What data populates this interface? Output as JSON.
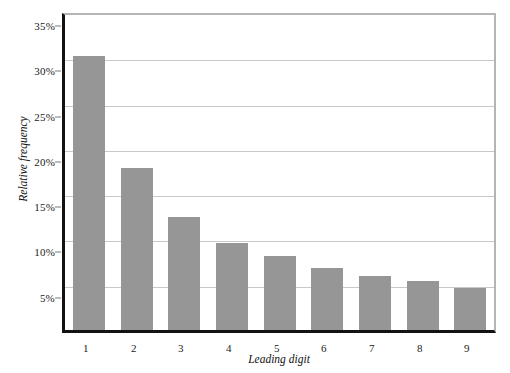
{
  "chart_data": {
    "type": "bar",
    "title": "",
    "subtitle": "",
    "xlabel": "Leading digit",
    "ylabel": "Relative frequency",
    "categories": [
      "1",
      "2",
      "3",
      "4",
      "5",
      "6",
      "7",
      "8",
      "9"
    ],
    "values": [
      30.3,
      17.9,
      12.5,
      9.6,
      8.2,
      6.8,
      6.0,
      5.4,
      4.6
    ],
    "value_unit": "%",
    "ylim": [
      0,
      35
    ],
    "yticks": [
      5,
      10,
      15,
      20,
      25,
      30,
      35
    ],
    "ytick_labels": [
      "5%",
      "10%",
      "15%",
      "20%",
      "25%",
      "30%",
      "35%"
    ],
    "grid": "horizontal",
    "legend": "none",
    "bar_color": "#969696",
    "gridline_color": "#c8c8c8",
    "axis_color": "#121212",
    "frame_color": "#b5b5b5",
    "annotations": []
  }
}
